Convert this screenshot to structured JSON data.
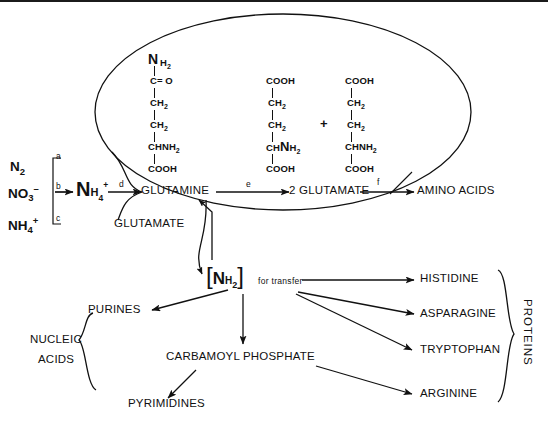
{
  "diagram": {
    "cell_outline": "oval",
    "line_color": "#111111",
    "background": "#ffffff"
  },
  "inputs": {
    "items": [
      {
        "id": "n2",
        "base": "N",
        "sub": "2",
        "sup": ""
      },
      {
        "id": "no3",
        "base": "NO",
        "sub": "3",
        "sup": "-"
      },
      {
        "id": "nh4",
        "base": "NH",
        "sub": "4",
        "sup": "+"
      }
    ],
    "bracket_labels": [
      "a",
      "b",
      "c"
    ]
  },
  "hub": {
    "base": "N",
    "sub": "H",
    "sub2": "4",
    "sup": "+"
  },
  "enzyme_labels": {
    "d": "d",
    "e": "e",
    "f": "f"
  },
  "pathway": {
    "glutamine": "GLUTAMINE",
    "glutamate_feedback": "GLUTAMATE",
    "two_glutamate": "2 GLUTAMATE",
    "amino_acids": "AMINO ACIDS"
  },
  "structures": {
    "glutamine": {
      "name": "glutamine",
      "rows": [
        "NH2",
        "C= O",
        "CH2",
        "CH2",
        "CHNH2",
        "COOH"
      ]
    },
    "glutamate_left": {
      "name": "glutamate",
      "rows": [
        "COOH",
        "CH2",
        "CH2",
        "CHNH2",
        "COOH"
      ]
    },
    "glutamate_right": {
      "name": "glutamate",
      "rows": [
        "COOH",
        "CH2",
        "CH2",
        "CHNH2",
        "COOH"
      ]
    },
    "operator": "+"
  },
  "transfer": {
    "bracket_open": "[",
    "bracket_close": "]",
    "group_base": "N",
    "group_sub": "H",
    "group_sub2": "2",
    "caption": "for  transfer"
  },
  "products": {
    "purines": "PURINES",
    "pyrimidines": "PYRIMIDINES",
    "nucleic_acids_line1": "NUCLEIC",
    "nucleic_acids_line2": "ACIDS",
    "carbamoyl_phosphate": "CARBAMOYL PHOSPHATE"
  },
  "amino_acids": {
    "items": [
      "HISTIDINE",
      "ASPARAGINE",
      "TRYPTOPHAN",
      "ARGININE"
    ],
    "group_label": "PROTEINS"
  }
}
